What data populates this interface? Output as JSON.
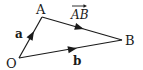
{
  "diagram": {
    "type": "vector-triangle",
    "points": {
      "O": {
        "label": "O",
        "x": 19,
        "y": 58
      },
      "A": {
        "label": "A",
        "x": 42,
        "y": 17
      },
      "B": {
        "label": "B",
        "x": 122,
        "y": 40
      }
    },
    "vectors": [
      {
        "from": "O",
        "to": "A",
        "label": "a",
        "bold": true
      },
      {
        "from": "O",
        "to": "B",
        "label": "b",
        "bold": true
      },
      {
        "from": "A",
        "to": "B",
        "label": "AB",
        "overarrow": true
      }
    ],
    "labels": {
      "O": "O",
      "A": "A",
      "B": "B",
      "a": "a",
      "b": "b",
      "AB": "AB"
    },
    "colors": {
      "stroke": "#1a1a1a",
      "background": "#ffffff"
    }
  }
}
